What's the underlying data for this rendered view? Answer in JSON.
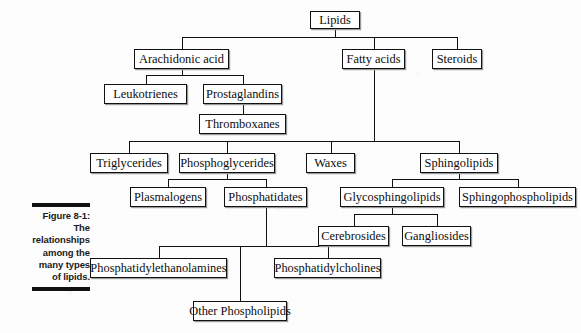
{
  "figure": {
    "label": "Figure 8-1:",
    "caption_lines": [
      "The",
      "relationships",
      "among the",
      "many types",
      "of lipids."
    ],
    "full_caption": "Figure 8-1: The relationships among the many types of lipids."
  },
  "colors": {
    "background": "#fdfdfd",
    "box_fill": "#ffffff",
    "box_border": "#111111",
    "line": "#111111",
    "text": "#0d0d0d",
    "caption_text": "#1a1a1a",
    "shadow": "#9a9a9a"
  },
  "chart_data": {
    "type": "diagram",
    "title": "Figure 8-1: The relationships among the many types of lipids.",
    "diagram_kind": "hierarchy-tree",
    "nodes": [
      {
        "id": "lipids",
        "label": "Lipids",
        "level": 0,
        "x": 310,
        "y": 11,
        "w": 50,
        "h": 18
      },
      {
        "id": "arachidonic_acid",
        "label": "Arachidonic acid",
        "level": 1,
        "x": 134,
        "y": 49,
        "w": 95,
        "h": 20
      },
      {
        "id": "fatty_acids",
        "label": "Fatty acids",
        "level": 1,
        "x": 342,
        "y": 49,
        "w": 63,
        "h": 20
      },
      {
        "id": "steroids",
        "label": "Steroids",
        "level": 1,
        "x": 432,
        "y": 49,
        "w": 50,
        "h": 20
      },
      {
        "id": "leukotrienes",
        "label": "Leukotrienes",
        "level": 2,
        "x": 104,
        "y": 84,
        "w": 83,
        "h": 20
      },
      {
        "id": "prostaglandins",
        "label": "Prostaglandins",
        "level": 2,
        "x": 203,
        "y": 84,
        "w": 79,
        "h": 20
      },
      {
        "id": "thromboxanes",
        "label": "Thromboxanes",
        "level": 3,
        "x": 199,
        "y": 114,
        "w": 87,
        "h": 20
      },
      {
        "id": "triglycerides",
        "label": "Triglycerides",
        "level": 2,
        "x": 90,
        "y": 153,
        "w": 78,
        "h": 20
      },
      {
        "id": "phosphoglycerides",
        "label": "Phosphoglycerides",
        "level": 2,
        "x": 179,
        "y": 153,
        "w": 96,
        "h": 20
      },
      {
        "id": "waxes",
        "label": "Waxes",
        "level": 2,
        "x": 306,
        "y": 153,
        "w": 49,
        "h": 20
      },
      {
        "id": "sphingolipids",
        "label": "Sphingolipids",
        "level": 2,
        "x": 420,
        "y": 153,
        "w": 78,
        "h": 20
      },
      {
        "id": "plasmalogens",
        "label": "Plasmalogens",
        "level": 3,
        "x": 130,
        "y": 187,
        "w": 76,
        "h": 20
      },
      {
        "id": "phosphatidates",
        "label": "Phosphatidates",
        "level": 3,
        "x": 224,
        "y": 187,
        "w": 83,
        "h": 20
      },
      {
        "id": "glycosphingolipids",
        "label": "Glycosphingolipids",
        "level": 3,
        "x": 340,
        "y": 187,
        "w": 104,
        "h": 20
      },
      {
        "id": "sphingophospholipids",
        "label": "Sphingophospholipids",
        "level": 3,
        "x": 459,
        "y": 187,
        "w": 117,
        "h": 20
      },
      {
        "id": "cerebrosides",
        "label": "Cerebrosides",
        "level": 4,
        "x": 318,
        "y": 226,
        "w": 71,
        "h": 20
      },
      {
        "id": "gangliosides",
        "label": "Gangliosides",
        "level": 4,
        "x": 402,
        "y": 226,
        "w": 69,
        "h": 20
      },
      {
        "id": "phosphatidylethanolamines",
        "label": "Phosphatidylethanolamines",
        "level": 4,
        "x": 90,
        "y": 258,
        "w": 137,
        "h": 20
      },
      {
        "id": "phosphatidylcholines",
        "label": "Phosphatidylcholines",
        "level": 4,
        "x": 274,
        "y": 258,
        "w": 107,
        "h": 20
      },
      {
        "id": "other_phospholipids",
        "label": "Other Phospholipids",
        "level": 4,
        "x": 193,
        "y": 301,
        "w": 94,
        "h": 20
      }
    ],
    "edges": [
      {
        "from": "lipids",
        "to": "arachidonic_acid"
      },
      {
        "from": "lipids",
        "to": "fatty_acids"
      },
      {
        "from": "lipids",
        "to": "steroids"
      },
      {
        "from": "arachidonic_acid",
        "to": "leukotrienes"
      },
      {
        "from": "arachidonic_acid",
        "to": "prostaglandins"
      },
      {
        "from": "prostaglandins",
        "to": "thromboxanes"
      },
      {
        "from": "fatty_acids",
        "to": "triglycerides"
      },
      {
        "from": "fatty_acids",
        "to": "phosphoglycerides"
      },
      {
        "from": "fatty_acids",
        "to": "waxes"
      },
      {
        "from": "fatty_acids",
        "to": "sphingolipids"
      },
      {
        "from": "phosphoglycerides",
        "to": "plasmalogens"
      },
      {
        "from": "phosphoglycerides",
        "to": "phosphatidates"
      },
      {
        "from": "sphingolipids",
        "to": "glycosphingolipids"
      },
      {
        "from": "sphingolipids",
        "to": "sphingophospholipids"
      },
      {
        "from": "glycosphingolipids",
        "to": "cerebrosides"
      },
      {
        "from": "glycosphingolipids",
        "to": "gangliosides"
      },
      {
        "from": "phosphatidates",
        "to": "phosphatidylethanolamines"
      },
      {
        "from": "phosphatidates",
        "to": "phosphatidylcholines"
      },
      {
        "from": "phosphatidates",
        "to": "other_phospholipids"
      }
    ]
  }
}
